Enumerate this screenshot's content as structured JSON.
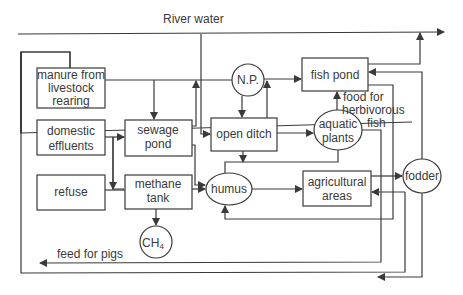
{
  "labels": {
    "river_water": "River water",
    "feed_for_pigs": "feed for pigs",
    "food_line1": "food for",
    "food_line2": "herbivorous",
    "food_line3": "fish"
  },
  "nodes": {
    "manure": [
      "manure from",
      "livestock",
      "rearing"
    ],
    "domestic": [
      "domestic",
      "effluents"
    ],
    "refuse": [
      "refuse"
    ],
    "sewage": [
      "sewage",
      "pond"
    ],
    "methane": [
      "methane",
      "tank"
    ],
    "ch4": "CH",
    "ch4_sub": "4",
    "np": "N.P.",
    "ditch": [
      "open ditch"
    ],
    "humus": "humus",
    "fishpond": [
      "fish pond"
    ],
    "aquatic": [
      "aquatic",
      "plants"
    ],
    "agri": [
      "agricultural",
      "areas"
    ],
    "fodder": "fodder"
  }
}
